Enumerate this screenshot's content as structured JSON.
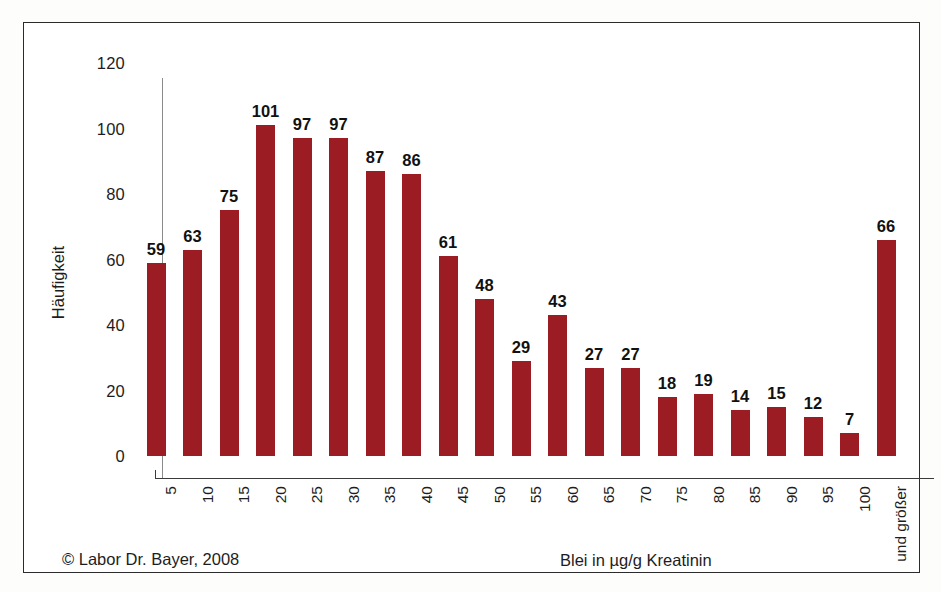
{
  "chart_data": {
    "type": "bar",
    "title": "",
    "xlabel": "Blei in µg/g Kreatinin",
    "ylabel": "Häufigkeit",
    "categories": [
      "5",
      "10",
      "15",
      "20",
      "25",
      "30",
      "35",
      "40",
      "45",
      "50",
      "55",
      "60",
      "65",
      "70",
      "75",
      "80",
      "85",
      "90",
      "95",
      "100",
      "und größer"
    ],
    "values": [
      59,
      63,
      75,
      101,
      97,
      97,
      87,
      86,
      61,
      48,
      29,
      43,
      27,
      27,
      18,
      19,
      14,
      15,
      12,
      7,
      66
    ],
    "ylim": [
      0,
      120
    ],
    "yticks": [
      0,
      20,
      40,
      60,
      80,
      100,
      120
    ],
    "grid": false,
    "legend": false,
    "bar_color": "#9c1c23",
    "value_labels": true
  },
  "footer": {
    "copyright": "© Labor Dr. Bayer, 2008"
  }
}
